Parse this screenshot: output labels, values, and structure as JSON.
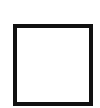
{
  "shape": {
    "type": "square-outline",
    "stroke_color": "#111111",
    "fill_color": "#ffffff"
  },
  "background_color": "#ffffff"
}
